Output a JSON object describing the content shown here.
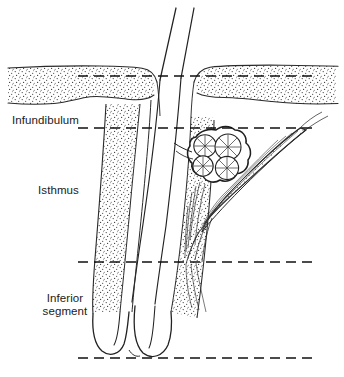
{
  "figure": {
    "type": "anatomical-line-drawing",
    "background_color": "#ffffff",
    "ink_color": "#1a1a1a",
    "width": 344,
    "height": 377
  },
  "labels": {
    "infundibulum": "Infundibulum",
    "isthmus": "Isthmus",
    "inferior_segment_line1": "Inferior",
    "inferior_segment_line2": "segment"
  },
  "zone_divider_lines": [
    {
      "name": "skin-surface-divider",
      "y": 76,
      "x_start": 78,
      "x_end": 316
    },
    {
      "name": "infundibulum-isthmus-divider",
      "y": 128,
      "x_start": 78,
      "x_end": 316
    },
    {
      "name": "isthmus-inferior-divider",
      "y": 262,
      "x_start": 78,
      "x_end": 316
    },
    {
      "name": "follicle-base-divider",
      "y": 358,
      "x_start": 78,
      "x_end": 316
    }
  ],
  "structures": [
    {
      "name": "hair-shaft",
      "description": "two parallel lines emerging above skin"
    },
    {
      "name": "epidermis",
      "description": "stippled surface band with rete ridges"
    },
    {
      "name": "outer-root-sheath",
      "description": "stippled follicular wall bands"
    },
    {
      "name": "sebaceous-gland",
      "description": "lobulated acini with radiating cells"
    },
    {
      "name": "arrector-pili-muscle",
      "description": "spindle-shaped fibrous band"
    },
    {
      "name": "hair-bulb",
      "description": "rounded base with dermal papilla"
    }
  ]
}
